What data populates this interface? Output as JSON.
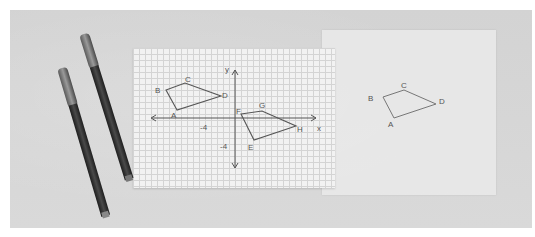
{
  "scene": {
    "description": "Photo of graph paper with coordinate axes and two quadrilaterals, a sheet of tracing paper with a traced quadrilateral, and two markers on a gray surface",
    "colors": {
      "surface": "#d6d6d6",
      "graph_paper": "#f2f2f2",
      "grid_lines": "#d4d4d4",
      "tracing_paper": "#eaeaea",
      "pencil_lines": "#666666",
      "marker_body": "#2a2a2a"
    }
  },
  "graph": {
    "axis_labels": {
      "x": "x",
      "y": "y"
    },
    "tick_labels": {
      "x_neg": "-4",
      "y_neg": "-4"
    },
    "shape_abcd": {
      "labels": {
        "A": "A",
        "B": "B",
        "C": "C",
        "D": "D"
      }
    },
    "shape_efgh": {
      "labels": {
        "E": "E",
        "F": "F",
        "G": "G",
        "H": "H"
      }
    }
  },
  "tracing": {
    "shape_abcd": {
      "labels": {
        "A": "A",
        "B": "B",
        "C": "C",
        "D": "D"
      }
    }
  },
  "markers": {
    "count": 2
  }
}
